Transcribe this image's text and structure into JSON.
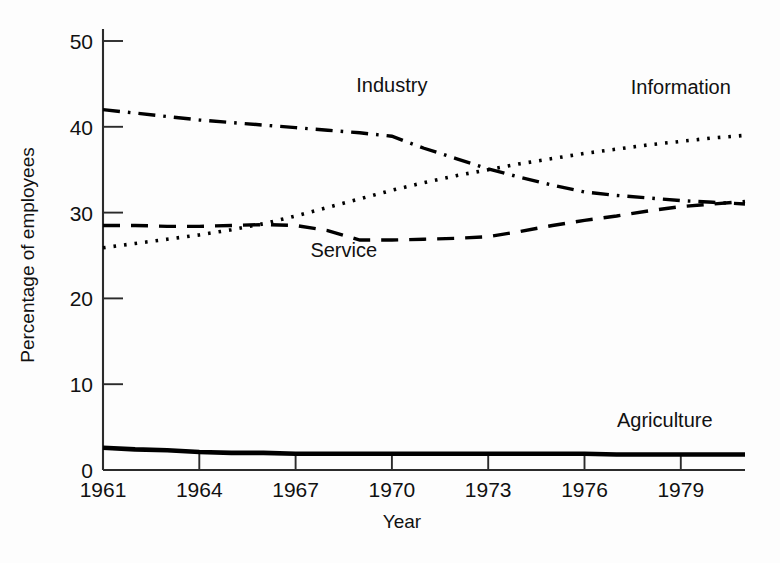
{
  "chart_data": {
    "type": "line",
    "title": "",
    "xlabel": "Year",
    "ylabel": "Percentage of employees",
    "xlim": [
      1961,
      1981
    ],
    "ylim": [
      0,
      50
    ],
    "grid": false,
    "legend": "inline-labels",
    "x_ticks": [
      "1961",
      "1964",
      "1967",
      "1970",
      "1973",
      "1976",
      "1979"
    ],
    "x_tick_values": [
      1961,
      1964,
      1967,
      1970,
      1973,
      1976,
      1979
    ],
    "y_ticks": [
      "0",
      "10",
      "20",
      "30",
      "40",
      "50"
    ],
    "y_tick_values": [
      0,
      10,
      20,
      30,
      40,
      50
    ],
    "x": [
      1961,
      1962,
      1963,
      1964,
      1965,
      1966,
      1967,
      1968,
      1969,
      1970,
      1971,
      1972,
      1973,
      1974,
      1975,
      1976,
      1977,
      1978,
      1979,
      1980,
      1981
    ],
    "series": [
      {
        "name": "Industry",
        "line_style": "dash-dot",
        "label_x": 1970.0,
        "label_y": 44.0,
        "values": [
          42.0,
          41.6,
          41.2,
          40.8,
          40.5,
          40.2,
          39.9,
          39.6,
          39.3,
          38.9,
          37.5,
          36.3,
          35.1,
          34.1,
          33.2,
          32.4,
          32.0,
          31.7,
          31.4,
          31.2,
          31.0
        ]
      },
      {
        "name": "Information",
        "line_style": "dotted",
        "label_x": 1979.0,
        "label_y": 43.8,
        "values": [
          25.9,
          26.4,
          26.9,
          27.4,
          28.0,
          28.7,
          29.6,
          30.6,
          31.6,
          32.6,
          33.5,
          34.3,
          35.0,
          35.7,
          36.3,
          36.9,
          37.4,
          37.9,
          38.3,
          38.7,
          39.0
        ]
      },
      {
        "name": "Service",
        "line_style": "dashed",
        "label_x": 1968.5,
        "label_y": 24.8,
        "values": [
          28.5,
          28.5,
          28.4,
          28.4,
          28.5,
          28.6,
          28.5,
          27.9,
          26.8,
          26.8,
          26.9,
          27.0,
          27.2,
          27.8,
          28.5,
          29.1,
          29.6,
          30.2,
          30.7,
          31.0,
          31.3
        ]
      },
      {
        "name": "Agriculture",
        "line_style": "solid",
        "label_x": 1978.5,
        "label_y": 5.0,
        "values": [
          2.6,
          2.4,
          2.3,
          2.1,
          2.0,
          2.0,
          1.9,
          1.9,
          1.9,
          1.9,
          1.9,
          1.9,
          1.9,
          1.9,
          1.9,
          1.9,
          1.8,
          1.8,
          1.8,
          1.8,
          1.8
        ]
      }
    ]
  },
  "colors": {
    "axis": "#2b2b2b",
    "line": "#000000",
    "background": "#fdfdfd",
    "text": "#111111"
  }
}
